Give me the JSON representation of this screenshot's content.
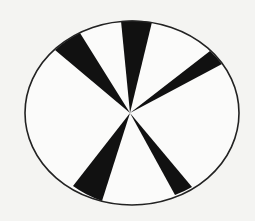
{
  "diagram": {
    "kind": "ellipse-with-radial-wedges",
    "colors": {
      "background": "#f4f4f2",
      "ellipse_fill": "#fbfbfa",
      "outline": "#222222",
      "wedge": "#111111"
    },
    "ellipse": {
      "cx": 132,
      "cy": 113,
      "rx": 107,
      "ry": 92,
      "stroke_width": 1.6
    },
    "hub": {
      "x": 130,
      "y": 113
    },
    "wedges": [
      {
        "name": "wedge-upper-left",
        "p1": [
          55,
          50
        ],
        "p2": [
          80,
          33
        ],
        "arc_sweep": 1
      },
      {
        "name": "wedge-top",
        "p1": [
          121,
          21
        ],
        "p2": [
          152,
          22
        ],
        "arc_sweep": 1
      },
      {
        "name": "wedge-right",
        "p1": [
          210,
          51
        ],
        "p2": [
          222,
          64
        ],
        "arc_sweep": 1
      },
      {
        "name": "wedge-lower-right",
        "p1": [
          192,
          187
        ],
        "p2": [
          175,
          195
        ],
        "arc_sweep": 1
      },
      {
        "name": "wedge-lower-left",
        "p1": [
          102,
          201
        ],
        "p2": [
          73,
          186
        ],
        "arc_sweep": 1
      }
    ]
  }
}
